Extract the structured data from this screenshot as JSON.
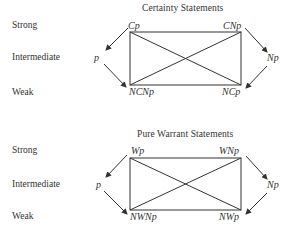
{
  "diagrams": [
    {
      "title": "Certainty Statements",
      "row_labels": {
        "strong": "Strong",
        "intermediate": "Intermediate",
        "weak": "Weak"
      },
      "nodes": {
        "top_left": "Cp",
        "top_right": "CNp",
        "left": "p",
        "right": "Np",
        "bottom_left": "NCNp",
        "bottom_right": "NCp"
      },
      "edges": [
        {
          "from": "Cp",
          "to": "CNp",
          "type": "line"
        },
        {
          "from": "CNp",
          "to": "NCp",
          "type": "line"
        },
        {
          "from": "NCNp",
          "to": "NCp",
          "type": "line"
        },
        {
          "from": "Cp",
          "to": "NCNp",
          "type": "line"
        },
        {
          "from": "Cp",
          "to": "NCp",
          "type": "line"
        },
        {
          "from": "CNp",
          "to": "NCNp",
          "type": "line"
        },
        {
          "from": "Cp",
          "to": "p",
          "type": "arrow"
        },
        {
          "from": "p",
          "to": "NCNp",
          "type": "arrow"
        },
        {
          "from": "CNp",
          "to": "Np",
          "type": "arrow"
        },
        {
          "from": "Np",
          "to": "NCp",
          "type": "arrow"
        }
      ]
    },
    {
      "title": "Pure Warrant Statements",
      "row_labels": {
        "strong": "Strong",
        "intermediate": "Intermediate",
        "weak": "Weak"
      },
      "nodes": {
        "top_left": "Wp",
        "top_right": "WNp",
        "left": "p",
        "right": "Np",
        "bottom_left": "NWNp",
        "bottom_right": "NWp"
      },
      "edges": [
        {
          "from": "Wp",
          "to": "WNp",
          "type": "line"
        },
        {
          "from": "WNp",
          "to": "NWp",
          "type": "line"
        },
        {
          "from": "NWNp",
          "to": "NWp",
          "type": "line"
        },
        {
          "from": "Wp",
          "to": "NWNp",
          "type": "line"
        },
        {
          "from": "Wp",
          "to": "NWp",
          "type": "line"
        },
        {
          "from": "WNp",
          "to": "NWNp",
          "type": "line"
        },
        {
          "from": "Wp",
          "to": "p",
          "type": "arrow"
        },
        {
          "from": "p",
          "to": "NWNp",
          "type": "arrow"
        },
        {
          "from": "WNp",
          "to": "Np",
          "type": "arrow"
        },
        {
          "from": "Np",
          "to": "NWp",
          "type": "arrow"
        }
      ]
    }
  ]
}
